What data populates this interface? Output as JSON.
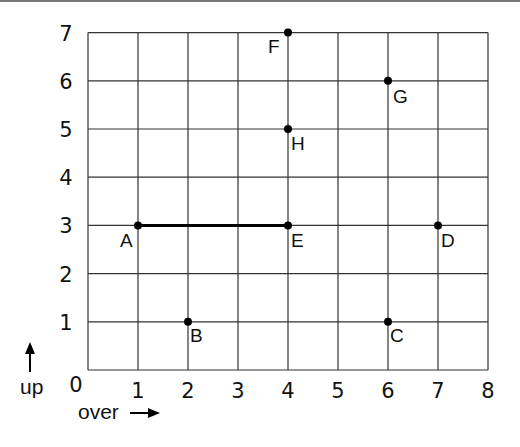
{
  "chart_data": {
    "type": "scatter",
    "title": "",
    "xlabel": "over",
    "ylabel": "up",
    "xlim": [
      0,
      8
    ],
    "ylim": [
      0,
      7
    ],
    "grid": true,
    "x_ticks": [
      "0",
      "1",
      "2",
      "3",
      "4",
      "5",
      "6",
      "7",
      "8"
    ],
    "y_ticks": [
      "1",
      "2",
      "3",
      "4",
      "5",
      "6",
      "7"
    ],
    "points": [
      {
        "label": "A",
        "x": 1,
        "y": 3
      },
      {
        "label": "B",
        "x": 2,
        "y": 1
      },
      {
        "label": "C",
        "x": 6,
        "y": 1
      },
      {
        "label": "D",
        "x": 7,
        "y": 3
      },
      {
        "label": "E",
        "x": 4,
        "y": 3
      },
      {
        "label": "F",
        "x": 4,
        "y": 7
      },
      {
        "label": "G",
        "x": 6,
        "y": 6
      },
      {
        "label": "H",
        "x": 4,
        "y": 5
      }
    ],
    "segments": [
      {
        "from": "A",
        "to": "E"
      }
    ]
  },
  "axes": {
    "origin_label": "0",
    "x_axis_label": "over",
    "y_axis_label": "up"
  }
}
